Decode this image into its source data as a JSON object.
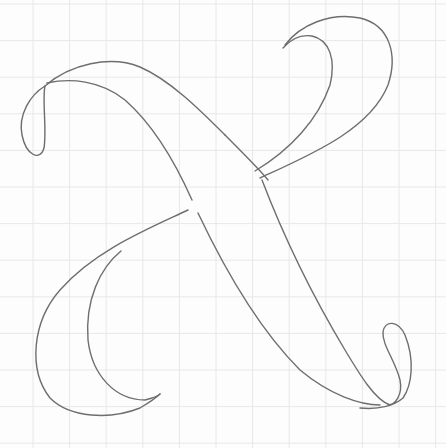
{
  "image": {
    "subject": "Pencil sketch of a calligraphic flourished letter X on grid (graph) paper",
    "letter": "X",
    "medium": "pencil on graph paper",
    "colors": {
      "paper": "#fdfdfd",
      "grid": "#e6e8ea",
      "pencil": "#6e6e6e"
    }
  }
}
